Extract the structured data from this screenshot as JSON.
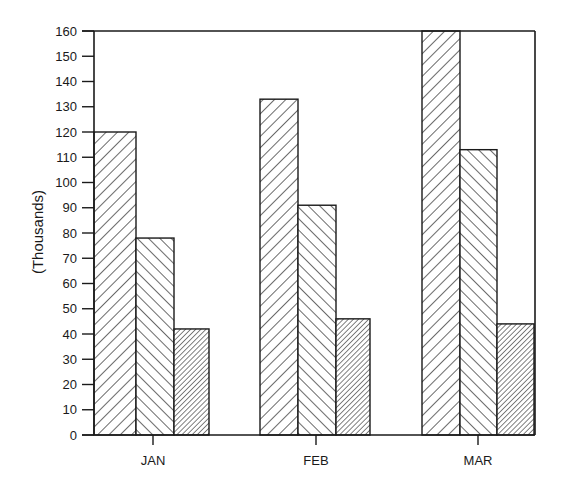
{
  "chart_data": {
    "type": "bar",
    "title": "",
    "xlabel": "",
    "ylabel": "(Thousands)",
    "ylim": [
      0,
      160
    ],
    "yticks": [
      0,
      10,
      20,
      30,
      40,
      50,
      60,
      70,
      80,
      90,
      100,
      110,
      120,
      130,
      140,
      150,
      160
    ],
    "categories": [
      "JAN",
      "FEB",
      "MAR"
    ],
    "series": [
      {
        "name": "Series 1",
        "pattern": "diagonal-forward-sparse",
        "values": [
          120,
          133,
          160
        ]
      },
      {
        "name": "Series 2",
        "pattern": "diagonal-backward-sparse",
        "values": [
          78,
          91,
          113
        ]
      },
      {
        "name": "Series 3",
        "pattern": "diagonal-forward-dense",
        "values": [
          42,
          46,
          44
        ]
      }
    ],
    "grid": false,
    "legend": "none",
    "frame": "box (top and right borders drawn)"
  },
  "colors": {
    "ink": "#1a1a1a",
    "background": "#ffffff"
  }
}
